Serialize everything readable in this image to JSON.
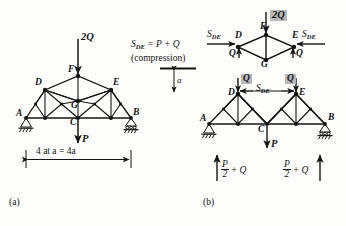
{
  "figure": {
    "background_color": "#fdfdfb",
    "line_color": "#141414",
    "highlight_color": "#b9b9b9",
    "panel_a_label": "(a)",
    "panel_b_label": "(b)"
  },
  "panel_a": {
    "nodes": {
      "A": "A",
      "B": "B",
      "C": "C",
      "D": "D",
      "E": "E",
      "F": "F",
      "G": "G"
    },
    "loads": {
      "top_load": "2Q",
      "bottom_load": "P"
    },
    "dimension": {
      "span_label": "4 at a = 4a"
    }
  },
  "center_note": {
    "equation": "S",
    "equation_sub": "DE",
    "equation_rest": " = P + Q",
    "qualifier": "(compression)",
    "height_dim": "a"
  },
  "panel_b": {
    "upper_fbd": {
      "applied_load": "2Q",
      "nodes": {
        "D": "D",
        "E": "E",
        "F": "F",
        "G": "G"
      },
      "left_force": "S",
      "left_force_sub": "DE",
      "right_force": "S",
      "right_force_sub": "DE",
      "left_reaction": "Q",
      "right_reaction": "Q"
    },
    "lower_fbd": {
      "nodes": {
        "A": "A",
        "B": "B",
        "C": "C",
        "D": "D",
        "E": "E"
      },
      "member_force": "S",
      "member_force_sub": "DE",
      "left_node_load": "Q",
      "right_node_load": "Q",
      "center_load": "P",
      "left_reaction_num": "P",
      "left_reaction_den": "2",
      "left_reaction_rest": "+ Q",
      "right_reaction_num": "P",
      "right_reaction_den": "2",
      "right_reaction_rest": "+ Q"
    }
  }
}
